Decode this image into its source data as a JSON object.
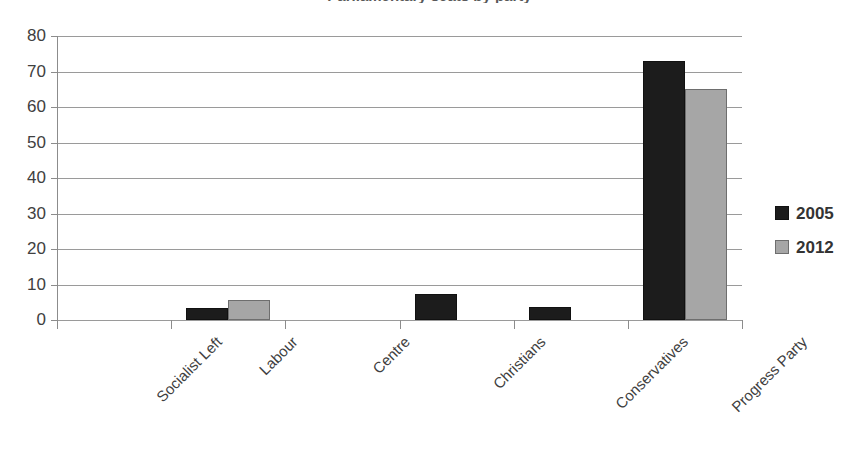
{
  "chart_data": {
    "type": "bar",
    "title": "",
    "xlabel": "",
    "ylabel": "",
    "ylim": [
      0,
      80
    ],
    "yticks": [
      0,
      10,
      20,
      30,
      40,
      50,
      60,
      70,
      80
    ],
    "ytick_labels": [
      "0",
      "10",
      "20",
      "30",
      "40",
      "50",
      "60",
      "70",
      "80"
    ],
    "grid": true,
    "legend_position": "right",
    "categories": [
      "Socialist Left",
      "Labour",
      "Centre",
      "Christians",
      "Conservatives",
      "Progress Party"
    ],
    "series": [
      {
        "name": "2005",
        "color": "#1c1c1c",
        "values": [
          0,
          3.5,
          0,
          7.3,
          3.8,
          73
        ]
      },
      {
        "name": "2012",
        "color": "#a6a6a6",
        "values": [
          0,
          5.5,
          0,
          0,
          0,
          65
        ]
      }
    ]
  },
  "legend": {
    "items": [
      {
        "label": "2005",
        "swatch": "s2005"
      },
      {
        "label": "2012",
        "swatch": "s2012"
      }
    ]
  },
  "colors": {
    "series_2005": "#1c1c1c",
    "series_2012": "#a6a6a6",
    "gridline": "#9a9a9a",
    "axis": "#8c8c8c",
    "text": "#404040",
    "background": "#ffffff"
  },
  "title_remnant": "Parliamentary seats by party"
}
